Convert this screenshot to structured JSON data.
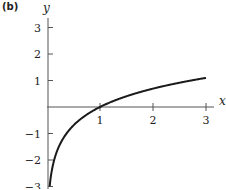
{
  "panel_label": "(b)",
  "chart_data": {
    "type": "line",
    "title": "",
    "function": "y = ln(x)",
    "xlabel": "x",
    "ylabel": "y",
    "xlim": [
      0,
      3.2
    ],
    "ylim": [
      -3,
      3.3
    ],
    "x_ticks": [
      1,
      2,
      3
    ],
    "x_tick_labels": [
      "1",
      "2",
      "3"
    ],
    "y_ticks": [
      3,
      2,
      1,
      -1,
      -2,
      -3
    ],
    "y_tick_labels": [
      "3",
      "2",
      "1",
      "−1",
      "−2",
      "−3"
    ],
    "grid": false,
    "legend": null,
    "series": [
      {
        "name": "ln(x)",
        "x": [
          0.05,
          0.1,
          0.2,
          0.3,
          0.5,
          0.75,
          1.0,
          1.5,
          2.0,
          2.5,
          3.0
        ],
        "y": [
          -3.0,
          -2.3,
          -1.61,
          -1.2,
          -0.69,
          -0.29,
          0.0,
          0.41,
          0.69,
          0.92,
          1.1
        ]
      }
    ],
    "colors": {
      "line": "#1a1a1a",
      "axis": "#555555"
    }
  }
}
